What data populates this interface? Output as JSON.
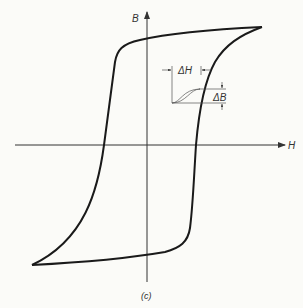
{
  "figure": {
    "caption": "(c)",
    "type": "hysteresis loop (B–H curve)",
    "axes": {
      "x_label": "H",
      "y_label": "B"
    },
    "inset": {
      "delta_h_label": "ΔH",
      "delta_b_label": "ΔB"
    },
    "colors": {
      "curve": "#1a1a1a",
      "axis": "#333333",
      "background": "#fbfbf8"
    }
  }
}
